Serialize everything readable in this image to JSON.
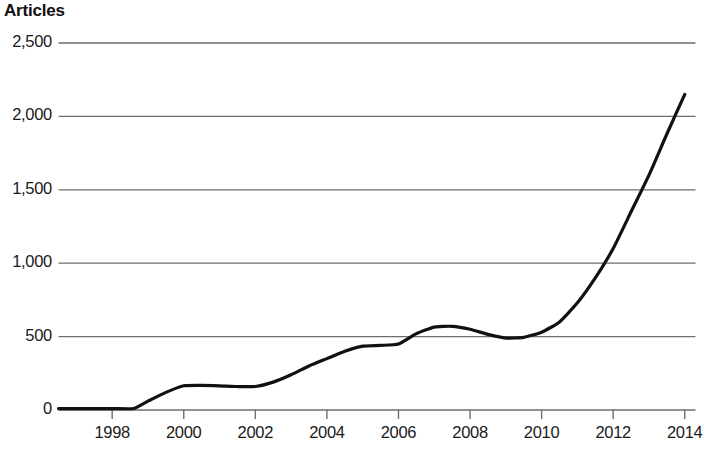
{
  "chart_data": {
    "type": "line",
    "title": "Articles",
    "xlabel": "",
    "ylabel": "Articles",
    "xlim": [
      1996.5,
      2014.3
    ],
    "ylim": [
      0,
      2500
    ],
    "grid": true,
    "legend": "none",
    "y_ticks": [
      {
        "value": 2500,
        "label": "2,500"
      },
      {
        "value": 2000,
        "label": "2,000"
      },
      {
        "value": 1500,
        "label": "1,500"
      },
      {
        "value": 1000,
        "label": "1,000"
      },
      {
        "value": 500,
        "label": "500"
      },
      {
        "value": 0,
        "label": "0"
      }
    ],
    "x_ticks": [
      {
        "value": 1998,
        "label": "1998"
      },
      {
        "value": 2000,
        "label": "2000"
      },
      {
        "value": 2002,
        "label": "2002"
      },
      {
        "value": 2004,
        "label": "2004"
      },
      {
        "value": 2006,
        "label": "2006"
      },
      {
        "value": 2008,
        "label": "2008"
      },
      {
        "value": 2010,
        "label": "2010"
      },
      {
        "value": 2012,
        "label": "2012"
      },
      {
        "value": 2014,
        "label": "2014"
      }
    ],
    "series": [
      {
        "name": "Articles",
        "color": "#111111",
        "x": [
          1996.5,
          1997,
          1998,
          1998.6,
          1999,
          1999.5,
          2000,
          2000.5,
          2001,
          2001.5,
          2002,
          2002.5,
          2003,
          2003.5,
          2004,
          2004.5,
          2005,
          2005.5,
          2006,
          2006.5,
          2007,
          2007.5,
          2008,
          2008.5,
          2009,
          2009.5,
          2010,
          2010.5,
          2011,
          2011.5,
          2012,
          2012.5,
          2013,
          2013.5,
          2014
        ],
        "y": [
          10,
          10,
          10,
          10,
          60,
          120,
          165,
          168,
          165,
          160,
          160,
          190,
          240,
          300,
          350,
          400,
          435,
          440,
          450,
          520,
          565,
          570,
          550,
          515,
          490,
          495,
          530,
          600,
          730,
          900,
          1100,
          1350,
          1600,
          1880,
          2150
        ]
      }
    ]
  }
}
